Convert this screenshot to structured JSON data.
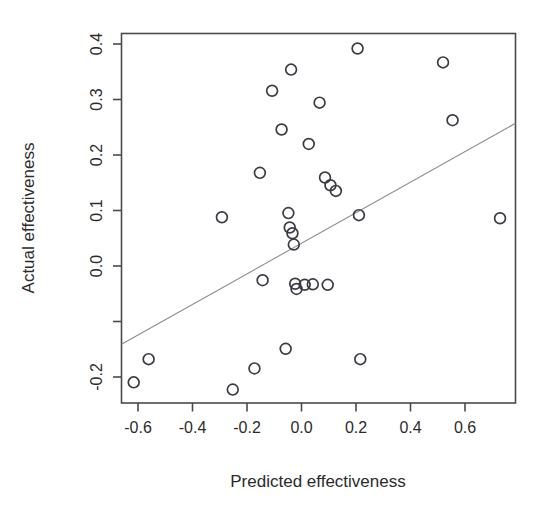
{
  "chart_data": {
    "type": "scatter",
    "title": "",
    "xlabel": "Predicted effectiveness",
    "ylabel": "Actual effectiveness",
    "xlim": [
      -0.665,
      0.787
    ],
    "ylim": [
      -0.283,
      0.433
    ],
    "grid": false,
    "legend": null,
    "xticks": [
      -0.6,
      -0.4,
      -0.2,
      0.0,
      0.2,
      0.4,
      0.6
    ],
    "xticklabels": [
      "-0.6",
      "-0.4",
      "-0.2",
      "0.0",
      "0.2",
      "0.4",
      "0.6"
    ],
    "yticks": [
      0.4,
      0.3,
      0.2,
      0.1,
      0.0,
      -0.1,
      -0.2
    ],
    "yticklabels": [
      "0.4",
      "0.3",
      "0.2",
      "0.1",
      "0.0",
      "",
      "-0.2"
    ],
    "marker": "open-circle",
    "marker_color": "#3b3b43",
    "x": [
      -0.62,
      -0.565,
      -0.295,
      -0.255,
      -0.175,
      -0.155,
      -0.145,
      -0.11,
      -0.075,
      -0.06,
      -0.05,
      -0.045,
      -0.04,
      -0.035,
      -0.03,
      -0.025,
      -0.02,
      0.01,
      0.025,
      0.04,
      0.065,
      0.085,
      0.095,
      0.105,
      0.125,
      0.205,
      0.21,
      0.215,
      0.52,
      0.555,
      0.73
    ],
    "y": [
      -0.243,
      -0.198,
      0.077,
      -0.257,
      -0.216,
      0.163,
      -0.045,
      0.322,
      0.247,
      -0.178,
      0.085,
      0.057,
      0.363,
      0.046,
      0.024,
      -0.052,
      -0.062,
      -0.054,
      0.219,
      -0.053,
      0.299,
      0.154,
      -0.054,
      0.139,
      0.128,
      0.404,
      0.081,
      -0.198,
      0.377,
      0.265,
      0.075
    ],
    "n_points": 31,
    "fit_line": {
      "type": "linear-regression",
      "color": "#8d8d8d",
      "x_start": -0.665,
      "y_start": -0.169,
      "x_end": 0.787,
      "y_end": 0.259
    }
  },
  "axes": {
    "x_title": "Predicted effectiveness",
    "y_title": "Actual effectiveness"
  },
  "x_tick_labels": {
    "t0": "-0.6",
    "t1": "-0.4",
    "t2": "-0.2",
    "t3": "0.0",
    "t4": "0.2",
    "t5": "0.4",
    "t6": "0.6"
  },
  "y_tick_labels": {
    "t0": "0.4",
    "t1": "0.3",
    "t2": "0.2",
    "t3": "0.1",
    "t4": "0.0",
    "t5": "-0.2"
  }
}
